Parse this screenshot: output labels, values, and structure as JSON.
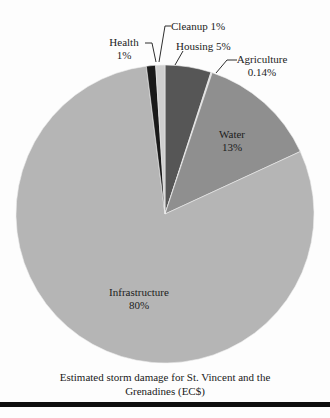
{
  "chart_data": {
    "type": "pie",
    "title": "Estimated storm damage for St. Vincent and the Grenadines (EC$)",
    "caption_lines": [
      "Estimated storm damage for St. Vincent and the",
      "Grenadines (EC$)"
    ],
    "legend_position": "none",
    "start_angle_deg": 0,
    "direction": "clockwise",
    "segments": [
      {
        "name": "Housing",
        "value_pct": 5,
        "color": "#565656",
        "label_lines": [
          "Housing 5%"
        ]
      },
      {
        "name": "Agriculture",
        "value_pct": 0.14,
        "color": "#d9d9d9",
        "label_lines": [
          "Agriculture",
          "0.14%"
        ]
      },
      {
        "name": "Water",
        "value_pct": 13,
        "color": "#8f8f8f",
        "label_lines": [
          "Water",
          "13%"
        ]
      },
      {
        "name": "Infrastructure",
        "value_pct": 80,
        "color": "#b5b5b5",
        "label_lines": [
          "Infrastructure",
          "80%"
        ]
      },
      {
        "name": "Health",
        "value_pct": 1,
        "color": "#1a1a1a",
        "label_lines": [
          "Health",
          "1%"
        ]
      },
      {
        "name": "Cleanup",
        "value_pct": 1,
        "color": "#cfcfcf",
        "label_lines": [
          "Cleanup 1%"
        ]
      }
    ],
    "colors": {
      "background": "#fdfdfd",
      "text": "#1c1c1c",
      "leader_line": "#2e2e2e",
      "slice_separator": "#ececec",
      "bottom_rule": "#0e0e0e"
    }
  }
}
